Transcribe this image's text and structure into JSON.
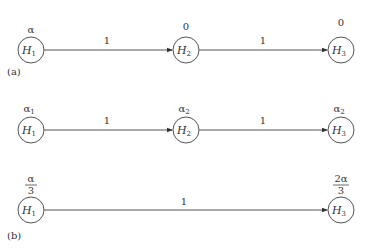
{
  "diagram": {
    "panels": [
      {
        "label": "(a)",
        "rows": [
          {
            "nodes": [
              {
                "name": "H",
                "sub": "1",
                "value": "α"
              },
              {
                "name": "H",
                "sub": "2",
                "value": "0"
              },
              {
                "name": "H",
                "sub": "3",
                "value": "0"
              }
            ],
            "edges": [
              {
                "from": "H1",
                "to": "H2",
                "weight": "1"
              },
              {
                "from": "H2",
                "to": "H3",
                "weight": "1"
              }
            ]
          }
        ]
      },
      {
        "label": "(b)",
        "rows": [
          {
            "nodes": [
              {
                "name": "H",
                "sub": "1",
                "value": "α",
                "value_sub": "1"
              },
              {
                "name": "H",
                "sub": "2",
                "value": "α",
                "value_sub": "2"
              },
              {
                "name": "H",
                "sub": "3",
                "value": "α",
                "value_sub": "2"
              }
            ],
            "edges": [
              {
                "from": "H1",
                "to": "H2",
                "weight": "1"
              },
              {
                "from": "H2",
                "to": "H3",
                "weight": "1"
              }
            ]
          },
          {
            "nodes": [
              {
                "name": "H",
                "sub": "1",
                "value_num": "α",
                "value_den": "3"
              },
              {
                "name": "H",
                "sub": "3",
                "value_num": "2α",
                "value_den": "3"
              }
            ],
            "edges": [
              {
                "from": "H1",
                "to": "H3",
                "weight": "1"
              }
            ]
          }
        ]
      }
    ]
  }
}
